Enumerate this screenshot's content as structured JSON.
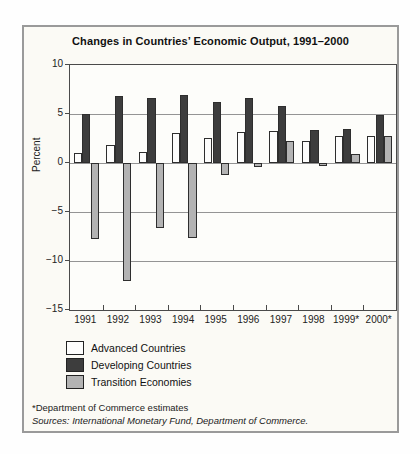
{
  "figure": {
    "title": "Changes in Countries’ Economic Output, 1991–2000",
    "ylabel": "Percent",
    "footnote1": "*Department of Commerce estimates",
    "footnote2": "Sources: International Monetary Fund, Department of Commerce."
  },
  "chart_data": {
    "type": "bar",
    "title": "Changes in Countries’ Economic Output, 1991–2000",
    "xlabel": "",
    "ylabel": "Percent",
    "categories": [
      "1991",
      "1992",
      "1993",
      "1994",
      "1995",
      "1996",
      "1997",
      "1998",
      "1999*",
      "2000*"
    ],
    "series": [
      {
        "name": "Advanced Countries",
        "color": "#fdfdfc",
        "values": [
          1.0,
          1.8,
          1.1,
          3.1,
          2.6,
          3.2,
          3.3,
          2.2,
          2.8,
          2.8
        ]
      },
      {
        "name": "Developing Countries",
        "color": "#3d3d3d",
        "values": [
          5.0,
          6.8,
          6.6,
          6.9,
          6.2,
          6.6,
          5.8,
          3.4,
          3.5,
          4.9
        ]
      },
      {
        "name": "Transition Economies",
        "color": "#b3b3b3",
        "values": [
          -7.7,
          -12.0,
          -6.6,
          -7.6,
          -1.2,
          -0.4,
          2.2,
          -0.3,
          0.9,
          2.8
        ]
      }
    ],
    "ylim": [
      -15,
      10
    ],
    "yticks": [
      10,
      5,
      0,
      -5,
      -10,
      -15
    ],
    "ytick_labels": [
      "10",
      "5",
      "0",
      "−5",
      "−10",
      "−15"
    ],
    "grid": true,
    "legend_position": "below-left",
    "colors": {
      "figure_background": "#fbfaf5",
      "plot_background": "#fdfdfa",
      "gridline": "#949494",
      "bar_outline": "#2e2e2e",
      "border": "#9a9a9a"
    }
  }
}
